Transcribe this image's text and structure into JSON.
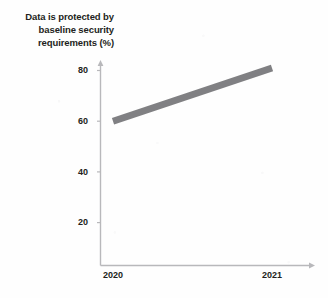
{
  "chart_data": {
    "type": "line",
    "title": "Data is protected by baseline security requirements (%)",
    "title_lines": [
      "Data is protected by",
      "baseline security",
      "requirements (%)"
    ],
    "xlabel": "",
    "ylabel": "",
    "x": [
      "2020",
      "2021"
    ],
    "categories": [
      "2020",
      "2021"
    ],
    "values": [
      60,
      81
    ],
    "series": [
      {
        "name": "Data is protected by baseline security requirements (%)",
        "values": [
          60,
          81
        ]
      }
    ],
    "ylim": [
      0,
      88
    ],
    "yticks": [
      20,
      40,
      60,
      80
    ],
    "ytick_labels": [
      "20",
      "40",
      "60",
      "80"
    ],
    "xtick_labels": [
      "2020",
      "2021"
    ],
    "grid": false,
    "legend": "none",
    "line_color": "#808083",
    "axis_color": "#b8b8bb",
    "text_color": "#231f20",
    "line_width_px": 7,
    "annotations": []
  }
}
